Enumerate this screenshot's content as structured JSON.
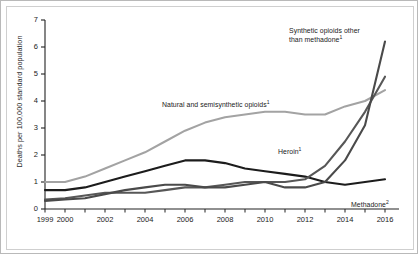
{
  "chart_data": {
    "type": "line",
    "title": "",
    "xlabel": "",
    "ylabel": "Deaths per 100,000 standard population",
    "xlim": [
      1999,
      2016
    ],
    "ylim": [
      0,
      7
    ],
    "yticks": [
      "0",
      "1",
      "2",
      "3",
      "4",
      "5",
      "6",
      "7"
    ],
    "xticks": [
      "1999",
      "2000",
      "2002",
      "2004",
      "2006",
      "2008",
      "2010",
      "2012",
      "2014",
      "2016"
    ],
    "x": [
      1999,
      2000,
      2001,
      2002,
      2003,
      2004,
      2005,
      2006,
      2007,
      2008,
      2009,
      2010,
      2011,
      2012,
      2013,
      2014,
      2015,
      2016
    ],
    "grid": false,
    "legend_position": "inline-annotations",
    "series": [
      {
        "name": "Natural and semisynthetic opioids",
        "footnote": "1",
        "color": "#a3a3a3",
        "values": [
          1.0,
          1.0,
          1.2,
          1.5,
          1.8,
          2.1,
          2.5,
          2.9,
          3.2,
          3.4,
          3.5,
          3.6,
          3.6,
          3.5,
          3.5,
          3.8,
          4.0,
          4.4
        ]
      },
      {
        "name": "Methadone",
        "footnote": "2",
        "color": "#1c1c1c",
        "values": [
          0.7,
          0.7,
          0.8,
          1.0,
          1.2,
          1.4,
          1.6,
          1.8,
          1.8,
          1.7,
          1.5,
          1.4,
          1.3,
          1.2,
          1.0,
          0.9,
          1.0,
          1.1
        ]
      },
      {
        "name": "Heroin",
        "footnote": "1",
        "color": "#575757",
        "values": [
          0.35,
          0.4,
          0.5,
          0.6,
          0.6,
          0.6,
          0.7,
          0.8,
          0.8,
          0.9,
          1.0,
          1.0,
          1.0,
          1.1,
          1.6,
          2.5,
          3.6,
          4.9
        ]
      },
      {
        "name": "Synthetic opioids other than methadone",
        "footnote": "1",
        "color": "#4a4a4a",
        "values": [
          0.3,
          0.35,
          0.4,
          0.55,
          0.7,
          0.8,
          0.9,
          0.9,
          0.8,
          0.8,
          0.9,
          1.0,
          0.8,
          0.8,
          1.0,
          1.8,
          3.1,
          6.2
        ]
      }
    ],
    "annotations": [
      {
        "id": "ann-synthetic",
        "text": "Synthetic opioids other",
        "text2": "than methadone",
        "footnote": "1"
      },
      {
        "id": "ann-natural",
        "text": "Natural and semisynthetic opioids",
        "footnote": "1"
      },
      {
        "id": "ann-heroin",
        "text": "Heroin",
        "footnote": "1"
      },
      {
        "id": "ann-methadone",
        "text": "Methadone",
        "footnote": "2"
      }
    ]
  }
}
